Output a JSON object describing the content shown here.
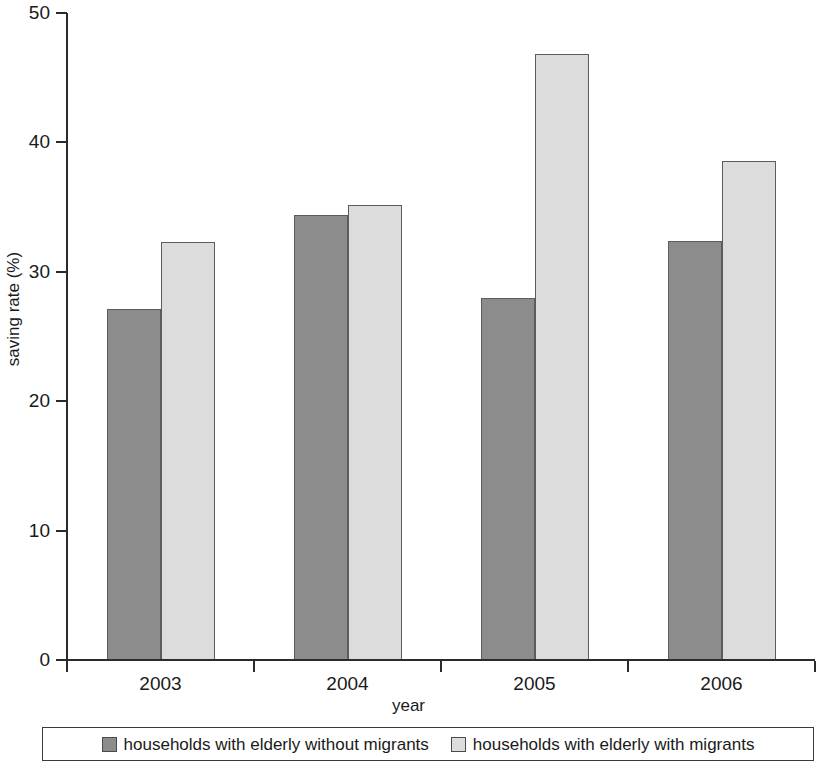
{
  "chart_data": {
    "type": "bar",
    "title": "",
    "subtitle": "",
    "xlabel": "year",
    "ylabel": "saving rate (%)",
    "categories": [
      "2003",
      "2004",
      "2005",
      "2006"
    ],
    "series": [
      {
        "name": "households with elderly without migrants",
        "color": "#8c8c8c",
        "values": [
          27.1,
          34.4,
          28.0,
          32.4
        ]
      },
      {
        "name": "households with elderly with migrants",
        "color": "#dcdcdc",
        "values": [
          32.3,
          35.2,
          46.8,
          38.6
        ]
      }
    ],
    "ylim": [
      0,
      50
    ],
    "yticks": [
      0,
      10,
      20,
      30,
      40,
      50
    ],
    "ytick_labels": [
      "0",
      "10",
      "20",
      "30",
      "40",
      "50"
    ],
    "xtick_labels": [
      "2003",
      "2004",
      "2005",
      "2006"
    ],
    "grid": false,
    "legend_position": "bottom",
    "axis_color": "#2b2b2b",
    "bar_edge_color": "#5c5c5c"
  }
}
